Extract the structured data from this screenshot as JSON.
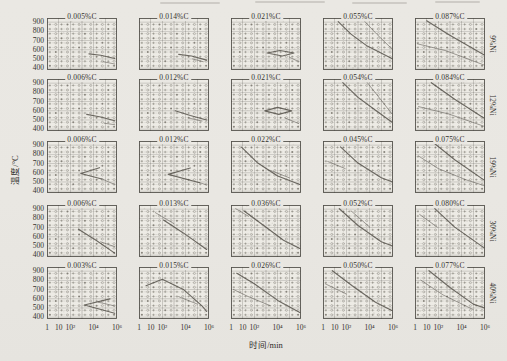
{
  "colors": {
    "paper": "#e9e7e2",
    "plot_paper": "#edebe5",
    "ink": "#3b3834",
    "symbol": "#6f6b63",
    "curve": "#4c4841"
  },
  "chart_data": {
    "type": "line",
    "xlabel": "时间/min",
    "ylabel": "温度/°C",
    "x_scale": "log",
    "xlim_log": [
      0,
      6
    ],
    "ylim": [
      380,
      945
    ],
    "x_ticks": [
      {
        "label": "1",
        "log": 0
      },
      {
        "label": "10",
        "log": 1
      },
      {
        "label": "10²",
        "log": 2
      },
      {
        "label": "10⁴",
        "log": 4
      },
      {
        "label": "10⁶",
        "log": 6
      }
    ],
    "y_ticks": [
      "900",
      "800",
      "700",
      "600",
      "500",
      "400"
    ],
    "y_tick_values": [
      900,
      800,
      700,
      600,
      500,
      400
    ],
    "y_gridlines": [
      400,
      500,
      600,
      700,
      800,
      900
    ],
    "point_grid": {
      "log_start": 0.25,
      "log_step": 0.5,
      "cols": 12,
      "t_start": 425,
      "t_step": 50,
      "rows": 10,
      "symbols": [
        "plus",
        "circle",
        "dot"
      ]
    },
    "rows": [
      {
        "ni": "9%Ni",
        "cells": [
          {
            "c": "0.005%C",
            "curves": [
              [
                [
                  3.6,
                  555
                ],
                [
                  4.6,
                  540
                ],
                [
                  5.8,
                  505
                ]
              ],
              [
                [
                  4.8,
                  470
                ],
                [
                  5.8,
                  445
                ]
              ]
            ]
          },
          {
            "c": "0.014%C",
            "curves": [
              [
                [
                  3.4,
                  550
                ],
                [
                  4.5,
                  532
                ],
                [
                  5.8,
                  488
                ]
              ],
              [
                [
                  4.6,
                  500
                ],
                [
                  5.5,
                  470
                ]
              ]
            ]
          },
          {
            "c": "0.021%C",
            "curves": [
              [
                [
                  3.1,
                  565
                ],
                [
                  4.2,
                  592
                ],
                [
                  5.4,
                  565
                ],
                [
                  4.4,
                  532
                ],
                [
                  3.1,
                  565
                ]
              ],
              [
                [
                  5.0,
                  520
                ],
                [
                  5.8,
                  470
                ]
              ]
            ]
          },
          {
            "c": "0.055%C",
            "curves": [
              [
                [
                  1.3,
                  905
                ],
                [
                  2.4,
                  770
                ],
                [
                  3.8,
                  640
                ],
                [
                  5.9,
                  505
                ]
              ],
              [
                [
                  3.6,
                  905
                ],
                [
                  4.6,
                  770
                ],
                [
                  5.9,
                  610
                ]
              ]
            ]
          },
          {
            "c": "0.087%C",
            "curves": [
              [
                [
                  1.0,
                  915
                ],
                [
                  2.8,
                  770
                ],
                [
                  5.9,
                  545
                ]
              ],
              [
                [
                  0.2,
                  665
                ],
                [
                  2.6,
                  592
                ],
                [
                  5.9,
                  435
                ]
              ]
            ]
          }
        ]
      },
      {
        "ni": "12%Ni",
        "cells": [
          {
            "c": "0.006%C",
            "curves": [
              [
                [
                  3.4,
                  560
                ],
                [
                  4.6,
                  532
                ],
                [
                  5.8,
                  492
                ]
              ],
              [
                [
                  4.9,
                  465
                ],
                [
                  5.8,
                  448
                ]
              ]
            ]
          },
          {
            "c": "0.012%C",
            "curves": [
              [
                [
                  3.1,
                  600
                ],
                [
                  4.4,
                  548
                ],
                [
                  5.8,
                  500
                ]
              ],
              [
                [
                  4.3,
                  520
                ],
                [
                  5.4,
                  488
                ]
              ]
            ]
          },
          {
            "c": "0.021%C",
            "curves": [
              [
                [
                  2.9,
                  598
                ],
                [
                  4.0,
                  636
                ],
                [
                  5.2,
                  598
                ],
                [
                  4.1,
                  560
                ],
                [
                  2.9,
                  598
                ]
              ],
              [
                [
                  4.6,
                  522
                ],
                [
                  5.8,
                  462
                ]
              ]
            ]
          },
          {
            "c": "0.054%C",
            "curves": [
              [
                [
                  1.7,
                  905
                ],
                [
                  3.0,
                  745
                ],
                [
                  4.5,
                  605
                ],
                [
                  5.9,
                  478
                ]
              ],
              [
                [
                  3.8,
                  905
                ],
                [
                  4.8,
                  745
                ],
                [
                  5.9,
                  568
                ]
              ]
            ]
          },
          {
            "c": "0.084%C",
            "curves": [
              [
                [
                  1.4,
                  905
                ],
                [
                  3.4,
                  725
                ],
                [
                  5.9,
                  522
                ]
              ],
              [
                [
                  0.3,
                  645
                ],
                [
                  2.9,
                  565
                ],
                [
                  5.9,
                  432
                ]
              ]
            ]
          }
        ]
      },
      {
        "ni": "19%Ni",
        "cells": [
          {
            "c": "0.006%C",
            "curves": [
              [
                [
                  4.5,
                  655
                ],
                [
                  2.9,
                  592
                ],
                [
                  4.7,
                  532
                ]
              ],
              [
                [
                  4.7,
                  532
                ],
                [
                  5.8,
                  472
                ]
              ]
            ]
          },
          {
            "c": "0.012%C",
            "curves": [
              [
                [
                  4.4,
                  652
                ],
                [
                  2.5,
                  582
                ],
                [
                  5.2,
                  492
                ]
              ],
              [
                [
                  5.2,
                  492
                ],
                [
                  5.8,
                  468
                ]
              ]
            ]
          },
          {
            "c": "0.022%C",
            "curves": [
              [
                [
                  0.9,
                  878
                ],
                [
                  2.3,
                  705
                ],
                [
                  4.0,
                  565
                ],
                [
                  5.9,
                  472
                ]
              ],
              [
                [
                  3.4,
                  625
                ],
                [
                  5.0,
                  545
                ]
              ]
            ]
          },
          {
            "c": "0.045%C",
            "curves": [
              [
                [
                  1.5,
                  882
                ],
                [
                  3.0,
                  705
                ],
                [
                  5.0,
                  545
                ],
                [
                  5.9,
                  502
                ]
              ],
              [
                [
                  0.4,
                  722
                ],
                [
                  1.9,
                  645
                ]
              ]
            ]
          },
          {
            "c": "0.075%C",
            "curves": [
              [
                [
                  1.7,
                  915
                ],
                [
                  3.4,
                  742
                ],
                [
                  5.9,
                  522
                ]
              ],
              [
                [
                  0.3,
                  782
                ],
                [
                  2.0,
                  645
                ],
                [
                  4.4,
                  522
                ],
                [
                  5.9,
                  462
                ]
              ]
            ]
          }
        ]
      },
      {
        "ni": "30%Ni",
        "cells": [
          {
            "c": "0.006%C",
            "curves": [
              [
                [
                  2.7,
                  682
                ],
                [
                  4.2,
                  562
                ],
                [
                  5.8,
                  422
                ]
              ],
              [
                [
                  4.6,
                  545
                ],
                [
                  5.8,
                  492
                ]
              ]
            ]
          },
          {
            "c": "0.013%C",
            "curves": [
              [
                [
                  2.1,
                  782
                ],
                [
                  3.8,
                  642
                ],
                [
                  5.8,
                  462
                ]
              ],
              [
                [
                  1.4,
                  862
                ],
                [
                  3.0,
                  742
                ]
              ]
            ]
          },
          {
            "c": "0.036%C",
            "curves": [
              [
                [
                  1.1,
                  882
                ],
                [
                  2.8,
                  722
                ],
                [
                  4.5,
                  562
                ],
                [
                  5.9,
                  472
                ]
              ],
              [
                [
                  0.4,
                  905
                ],
                [
                  1.5,
                  822
                ]
              ]
            ]
          },
          {
            "c": "0.052%C",
            "curves": [
              [
                [
                  1.4,
                  905
                ],
                [
                  3.0,
                  722
                ],
                [
                  5.0,
                  545
                ],
                [
                  5.9,
                  502
                ]
              ],
              [
                [
                  2.4,
                  882
                ],
                [
                  4.0,
                  705
                ]
              ]
            ]
          },
          {
            "c": "0.080%C",
            "curves": [
              [
                [
                  1.7,
                  905
                ],
                [
                  3.4,
                  705
                ],
                [
                  5.9,
                  482
                ]
              ],
              [
                [
                  0.4,
                  842
                ],
                [
                  1.9,
                  705
                ]
              ]
            ]
          }
        ]
      },
      {
        "ni": "40%Ni",
        "cells": [
          {
            "c": "0.003%C",
            "curves": [
              [
                [
                  5.4,
                  598
                ],
                [
                  3.2,
                  532
                ],
                [
                  5.8,
                  442
                ]
              ],
              [
                [
                  4.4,
                  562
                ],
                [
                  5.8,
                  522
                ]
              ]
            ]
          },
          {
            "c": "0.015%C",
            "curves": [
              [
                [
                  0.6,
                  742
                ],
                [
                  2.0,
                  812
                ],
                [
                  3.8,
                  702
                ],
                [
                  5.4,
                  522
                ],
                [
                  5.8,
                  462
                ]
              ],
              [
                [
                  3.4,
                  622
                ],
                [
                  5.0,
                  542
                ]
              ]
            ]
          },
          {
            "c": "0.026%C",
            "curves": [
              [
                [
                  0.5,
                  878
                ],
                [
                  2.0,
                  762
                ],
                [
                  4.0,
                  582
                ],
                [
                  5.9,
                  452
                ]
              ],
              [
                [
                  0.2,
                  702
                ],
                [
                  1.5,
                  622
                ],
                [
                  3.4,
                  522
                ]
              ]
            ]
          },
          {
            "c": "0.050%C",
            "curves": [
              [
                [
                  0.8,
                  905
                ],
                [
                  2.5,
                  742
                ],
                [
                  4.5,
                  562
                ],
                [
                  5.9,
                  472
                ]
              ],
              [
                [
                  0.2,
                  762
                ],
                [
                  2.0,
                  652
                ]
              ]
            ]
          },
          {
            "c": "0.077%C",
            "curves": [
              [
                [
                  1.2,
                  905
                ],
                [
                  3.0,
                  722
                ],
                [
                  5.0,
                  542
                ],
                [
                  5.9,
                  502
                ]
              ],
              [
                [
                  0.5,
                  802
                ],
                [
                  2.4,
                  642
                ],
                [
                  5.0,
                  482
                ]
              ]
            ]
          }
        ]
      }
    ]
  }
}
